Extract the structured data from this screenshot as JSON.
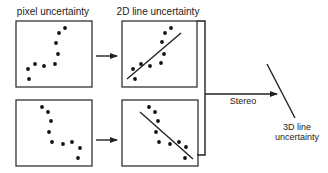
{
  "labels": {
    "pixel_uncertainty": "pixel uncertainty",
    "line_2d_uncertainty": "2D line uncertainty",
    "stereo": "Stereo",
    "line_3d_line1": "3D line",
    "line_3d_line2": "uncertainty"
  },
  "panels": [
    {
      "id": "top-left",
      "kind": "pixel",
      "points": [
        [
          65,
          28
        ],
        [
          59,
          33
        ],
        [
          56,
          43
        ],
        [
          58,
          54
        ],
        [
          55,
          64
        ],
        [
          44,
          66
        ],
        [
          35,
          64
        ],
        [
          28,
          69
        ],
        [
          29,
          79
        ]
      ]
    },
    {
      "id": "top-right",
      "kind": "line-fit",
      "points": [
        [
          171,
          28
        ],
        [
          165,
          33
        ],
        [
          162,
          42
        ],
        [
          164,
          54
        ],
        [
          161,
          63
        ],
        [
          150,
          66
        ],
        [
          141,
          64
        ],
        [
          133,
          69
        ],
        [
          135,
          79
        ]
      ],
      "fit_line": [
        [
          127,
          79
        ],
        [
          181,
          33
        ]
      ]
    },
    {
      "id": "bottom-left",
      "kind": "pixel",
      "points": [
        [
          42,
          107
        ],
        [
          48,
          112
        ],
        [
          51,
          121
        ],
        [
          49,
          132
        ],
        [
          52,
          142
        ],
        [
          63,
          144
        ],
        [
          72,
          142
        ],
        [
          80,
          148
        ],
        [
          78,
          158
        ]
      ]
    },
    {
      "id": "bottom-right",
      "kind": "line-fit",
      "points": [
        [
          149,
          107
        ],
        [
          155,
          112
        ],
        [
          158,
          121
        ],
        [
          156,
          132
        ],
        [
          159,
          142
        ],
        [
          170,
          144
        ],
        [
          179,
          142
        ],
        [
          186,
          147
        ],
        [
          185,
          158
        ]
      ],
      "fit_line": [
        [
          140,
          112
        ],
        [
          193,
          159
        ]
      ]
    }
  ]
}
